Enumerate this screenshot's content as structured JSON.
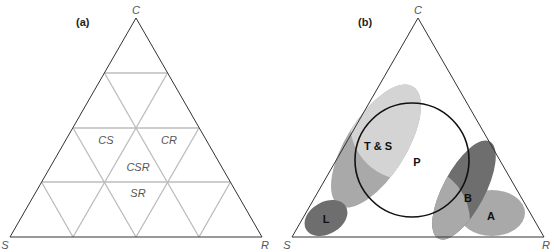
{
  "panel_a": {
    "label": "(a)",
    "corners": {
      "top": "C",
      "left": "S",
      "right": "R"
    },
    "regions": [
      {
        "label": "CS"
      },
      {
        "label": "CR"
      },
      {
        "label": "CSR"
      },
      {
        "label": "SR"
      }
    ]
  },
  "panel_b": {
    "label": "(b)",
    "corners": {
      "top": "C",
      "left": "S",
      "right": "R"
    },
    "shapes": [
      {
        "label": "T & S"
      },
      {
        "label": "P"
      },
      {
        "label": "L"
      },
      {
        "label": "B"
      },
      {
        "label": "A"
      }
    ]
  },
  "colors": {
    "outline": "#333333",
    "grid": "#bbbbbb",
    "light_gray": "#d4d4d4",
    "mid_gray": "#a9a9a9",
    "dark_gray": "#6e6e6e"
  }
}
